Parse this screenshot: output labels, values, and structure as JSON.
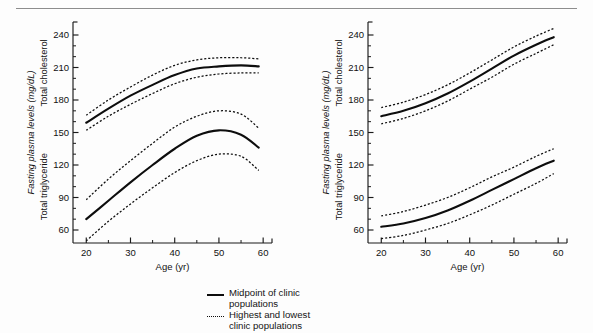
{
  "figure": {
    "background_color": "#fdfdfd",
    "ink_color": "#0d0d0d",
    "rule_color": "#8d8d8d"
  },
  "legend": {
    "items": [
      {
        "style": "solid",
        "marker_name": "solid-line-marker",
        "line1": "Midpoint of clinic",
        "line2": "populations"
      },
      {
        "style": "dashed",
        "marker_name": "dashed-line-marker",
        "line1": "Highest and lowest",
        "line2": "clinic populations"
      }
    ]
  },
  "chart_data": [
    {
      "type": "line",
      "panel": "left",
      "title": "",
      "xlabel": "Age (yr)",
      "ylabel_italic": "Fasting plasma levels (mg/dL)",
      "ylabel_upper": "Total cholesterol",
      "ylabel_lower": "Total triglyceride",
      "xlim": [
        17,
        62
      ],
      "ylim": [
        48,
        252
      ],
      "xticks": [
        20,
        30,
        40,
        50,
        60
      ],
      "xticks_minor": [
        25,
        35,
        45,
        55
      ],
      "yticks": [
        60,
        90,
        120,
        150,
        180,
        210,
        240
      ],
      "yticks_minor": [
        70,
        80,
        100,
        110,
        130,
        140,
        160,
        170,
        190,
        200,
        220,
        230
      ],
      "grid": false,
      "legend_position": "below-figure",
      "x": [
        20,
        25,
        30,
        35,
        40,
        45,
        50,
        55,
        59
      ],
      "series": [
        {
          "name": "Total cholesterol — highest clinic populations",
          "style": "dashed",
          "values": [
            166,
            180,
            192,
            203,
            212,
            217,
            219,
            219,
            218
          ]
        },
        {
          "name": "Total cholesterol — midpoint of clinic populations",
          "style": "solid",
          "values": [
            159,
            172,
            184,
            194,
            203,
            209,
            211,
            212,
            211
          ]
        },
        {
          "name": "Total cholesterol — lowest clinic populations",
          "style": "dashed",
          "values": [
            152,
            165,
            176,
            186,
            195,
            201,
            204,
            205,
            205
          ]
        },
        {
          "name": "Total triglyceride — highest clinic populations",
          "style": "dashed",
          "values": [
            88,
            107,
            124,
            140,
            155,
            165,
            170,
            167,
            154
          ]
        },
        {
          "name": "Total triglyceride — midpoint of clinic populations",
          "style": "solid",
          "values": [
            70,
            87,
            104,
            120,
            135,
            147,
            152,
            148,
            136
          ]
        },
        {
          "name": "Total triglyceride — lowest clinic populations",
          "style": "dashed",
          "values": [
            50,
            68,
            84,
            99,
            113,
            124,
            130,
            128,
            115
          ]
        }
      ]
    },
    {
      "type": "line",
      "panel": "right",
      "title": "",
      "xlabel": "Age (yr)",
      "ylabel_italic": "Fasting plasma levels (mg/dL)",
      "ylabel_upper": "Total cholesterol",
      "ylabel_lower": "Total triglyceride",
      "xlim": [
        17,
        62
      ],
      "ylim": [
        48,
        252
      ],
      "xticks": [
        20,
        30,
        40,
        50,
        60
      ],
      "xticks_minor": [
        25,
        35,
        45,
        55
      ],
      "yticks": [
        60,
        90,
        120,
        150,
        180,
        210,
        240
      ],
      "yticks_minor": [
        70,
        80,
        100,
        110,
        130,
        140,
        160,
        170,
        190,
        200,
        220,
        230
      ],
      "grid": false,
      "legend_position": "below-figure",
      "x": [
        20,
        25,
        30,
        35,
        40,
        45,
        50,
        55,
        59
      ],
      "series": [
        {
          "name": "Total cholesterol — highest clinic populations",
          "style": "dashed",
          "values": [
            173,
            178,
            185,
            194,
            205,
            217,
            229,
            239,
            246
          ]
        },
        {
          "name": "Total cholesterol — midpoint of clinic populations",
          "style": "solid",
          "values": [
            165,
            170,
            177,
            186,
            197,
            209,
            221,
            231,
            238
          ]
        },
        {
          "name": "Total cholesterol — lowest clinic populations",
          "style": "dashed",
          "values": [
            158,
            163,
            170,
            179,
            190,
            201,
            213,
            223,
            231
          ]
        },
        {
          "name": "Total triglyceride — highest clinic populations",
          "style": "dashed",
          "values": [
            73,
            77,
            83,
            90,
            99,
            109,
            118,
            128,
            135
          ]
        },
        {
          "name": "Total triglyceride — midpoint of clinic populations",
          "style": "solid",
          "values": [
            63,
            66,
            71,
            78,
            87,
            97,
            107,
            117,
            124
          ]
        },
        {
          "name": "Total triglyceride — lowest clinic populations",
          "style": "dashed",
          "values": [
            52,
            55,
            60,
            66,
            74,
            83,
            93,
            103,
            112
          ]
        }
      ]
    }
  ]
}
